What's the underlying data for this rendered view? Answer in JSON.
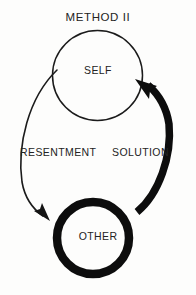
{
  "diagram": {
    "title": "METHOD II",
    "type": "cycle-diagram",
    "background_color": "#fdfdfc",
    "ink_color": "#111111",
    "text_color": "#232323",
    "nodes": [
      {
        "id": "self",
        "label": "SELF",
        "shape": "circle",
        "stroke": "thin",
        "cx": 97,
        "cy": 75,
        "r": 45
      },
      {
        "id": "other",
        "label": "OTHER",
        "shape": "circle",
        "stroke": "thick",
        "cx": 93,
        "cy": 238,
        "r": 40
      }
    ],
    "arrows": [
      {
        "id": "resentment",
        "label": "RESENTMENT",
        "from": "self",
        "to": "other",
        "side": "left",
        "weight": "thin",
        "direction": "downward"
      },
      {
        "id": "solution",
        "label": "SOLUTION",
        "from": "other",
        "to": "self",
        "side": "right",
        "weight": "thick",
        "direction": "upward"
      }
    ]
  }
}
